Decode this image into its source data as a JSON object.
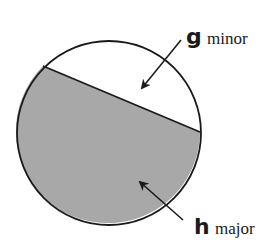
{
  "diagram": {
    "circle": {
      "cx": 109,
      "cy": 133,
      "r": 92
    },
    "chord": {
      "x1": 43,
      "y1": 66,
      "x2": 200,
      "y2": 132
    },
    "segments": [
      {
        "id": "minor",
        "fill": "#ffffff"
      },
      {
        "id": "major",
        "fill": "#a8a8a8"
      }
    ],
    "labels": {
      "minor": {
        "letter": "g",
        "word": "minor"
      },
      "major": {
        "letter": "h",
        "word": "major"
      }
    },
    "colors": {
      "stroke": "#1a1a1a",
      "shade": "#a8a8a8"
    }
  }
}
